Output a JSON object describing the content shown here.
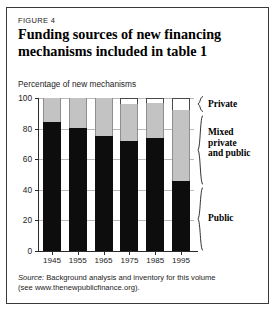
{
  "figure": {
    "label": "FIGURE 4",
    "title_line1": "Funding sources of new financing",
    "title_line2": "mechanisms included in table 1",
    "axis_caption": "Percentage of new mechanisms",
    "source_line1_prefix": "Source:",
    "source_line1": "Background analysis and inventory for this volume",
    "source_line2": "(see www.thenewpublicfinance.org)."
  },
  "legend": {
    "private": "Private",
    "mixed_line1": "Mixed",
    "mixed_line2": "private",
    "mixed_line3": "and public",
    "public": "Public"
  },
  "chart_data": {
    "type": "bar",
    "subtype": "stacked-percentage",
    "title": "Funding sources of new financing mechanisms included in table 1",
    "subtitle": "FIGURE 4",
    "xlabel": "",
    "ylabel": "Percentage of new mechanisms",
    "ylim": [
      0,
      100
    ],
    "yticks": [
      0,
      20,
      40,
      60,
      80,
      100
    ],
    "ytick_labels": [
      "0",
      "20",
      "40",
      "60",
      "80",
      "100"
    ],
    "grid": true,
    "grid_axis": "y",
    "legend_position": "right",
    "categories": [
      "1945",
      "1955",
      "1965",
      "1975",
      "1985",
      "1995"
    ],
    "series": [
      {
        "name": "Public",
        "color": "#0d0d0d",
        "values": [
          84,
          80.5,
          75,
          72,
          74,
          46
        ]
      },
      {
        "name": "Mixed private and public",
        "color": "#c3c3c3",
        "values": [
          16,
          19.5,
          25,
          24,
          23,
          46
        ]
      },
      {
        "name": "Private",
        "color": "#ffffff",
        "values": [
          0,
          0,
          0,
          4,
          3,
          8
        ]
      }
    ],
    "annotations": [
      "Source: Background analysis and inventory for this volume",
      "(see www.thenewpublicfinance.org)."
    ]
  }
}
